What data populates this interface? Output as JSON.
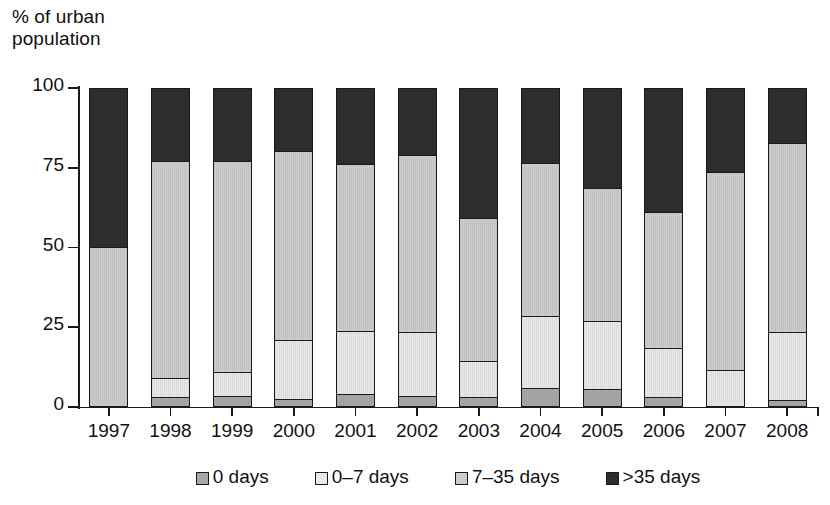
{
  "chart_data": {
    "type": "bar",
    "stacked": true,
    "title": "",
    "subtitle": "",
    "xlabel": "",
    "ylabel": "% of urban\npopulation",
    "ylim": [
      0,
      100
    ],
    "yticks": [
      0,
      25,
      50,
      75,
      100
    ],
    "ytick_labels": [
      "0",
      "25",
      "50",
      "75",
      "100"
    ],
    "grid": false,
    "legend_position": "bottom",
    "categories": [
      "1997",
      "1998",
      "1999",
      "2000",
      "2001",
      "2002",
      "2003",
      "2004",
      "2005",
      "2006",
      "2007",
      "2008"
    ],
    "series": [
      {
        "name": "0 days",
        "color": "#a8a8a8",
        "values": [
          0,
          2.5,
          3,
          2,
          3.5,
          3,
          2.5,
          5.5,
          5,
          2.5,
          0,
          1.5
        ]
      },
      {
        "name": "0–7 days",
        "color": "#e8e8e8",
        "values": [
          0,
          6,
          7.5,
          18.5,
          20,
          20,
          11.5,
          22.5,
          21.5,
          15.5,
          11,
          21.5
        ]
      },
      {
        "name": "7–35 days",
        "color": "#cccccc",
        "values": [
          50,
          68.5,
          66.5,
          59.5,
          52.5,
          56,
          45,
          48.5,
          42,
          43,
          62.5,
          59.5
        ]
      },
      {
        "name": ">35 days",
        "color": "#2e2e2e",
        "values": [
          50,
          23,
          23,
          20,
          24,
          21,
          41,
          23.5,
          31.5,
          39,
          26.5,
          17.5
        ]
      }
    ],
    "cumulative_tops": {
      "1997": [
        0,
        0,
        50,
        100
      ],
      "1998": [
        2.5,
        8.5,
        77,
        100
      ],
      "1999": [
        3,
        10.5,
        77,
        100
      ],
      "2000": [
        2,
        20.5,
        80,
        100
      ],
      "2001": [
        3.5,
        23.5,
        76,
        100
      ],
      "2002": [
        3,
        23,
        79,
        100
      ],
      "2003": [
        2.5,
        14,
        59,
        100
      ],
      "2004": [
        5.5,
        28,
        76.5,
        100
      ],
      "2005": [
        5,
        26.5,
        68.5,
        100
      ],
      "2006": [
        2.5,
        18,
        61,
        100
      ],
      "2007": [
        0,
        11,
        73.5,
        100
      ],
      "2008": [
        1.5,
        23,
        82.5,
        100
      ]
    }
  },
  "axis": {
    "y_title": "% of urban\npopulation"
  },
  "legend": {
    "items": [
      {
        "label": "0 days",
        "color": "#a8a8a8"
      },
      {
        "label": "0–7 days",
        "color": "#e8e8e8"
      },
      {
        "label": "7–35 days",
        "color": "#cccccc"
      },
      {
        "label": ">35 days",
        "color": "#2e2e2e"
      }
    ]
  }
}
